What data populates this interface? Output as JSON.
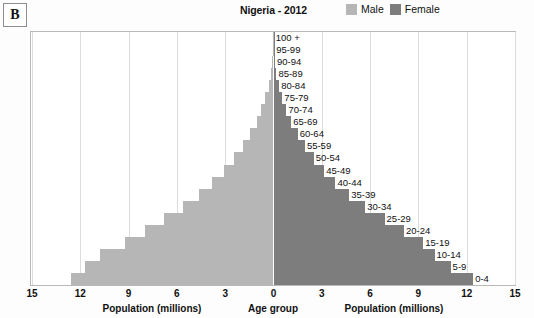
{
  "panel": {
    "letter": "B"
  },
  "header": {
    "title": "Nigeria - 2012",
    "legend": [
      {
        "label": "Male",
        "color": "#b6b6b6",
        "icon": "male-swatch"
      },
      {
        "label": "Female",
        "color": "#7d7d7d",
        "icon": "female-swatch"
      }
    ]
  },
  "axis": {
    "left_title": "Population (millions)",
    "center_title": "Age group",
    "right_title": "Population (millions)",
    "ticks": [
      "15",
      "12",
      "9",
      "6",
      "3",
      "0",
      "3",
      "6",
      "9",
      "12",
      "15"
    ]
  },
  "chart_data": {
    "type": "bar",
    "subtype": "population-pyramid",
    "title": "Nigeria - 2012",
    "xlabel": "Population (millions)",
    "ylabel": "Age group",
    "xlim": [
      -15,
      15
    ],
    "x_tick_values": [
      -15,
      -12,
      -9,
      -6,
      -3,
      0,
      3,
      6,
      9,
      12,
      15
    ],
    "x_tick_labels": [
      "15",
      "12",
      "9",
      "6",
      "3",
      "0",
      "3",
      "6",
      "9",
      "12",
      "15"
    ],
    "grid": true,
    "legend_position": "top-right",
    "categories": [
      "100 +",
      "95-99",
      "90-94",
      "85-89",
      "80-84",
      "75-79",
      "70-74",
      "65-69",
      "60-64",
      "55-59",
      "50-54",
      "45-49",
      "40-44",
      "35-39",
      "30-34",
      "25-29",
      "20-24",
      "15-19",
      "10-14",
      "5-9",
      "0-4"
    ],
    "series": [
      {
        "name": "Male",
        "color": "#b6b6b6",
        "side": "left",
        "values": [
          0.01,
          0.03,
          0.07,
          0.15,
          0.3,
          0.5,
          0.75,
          1.05,
          1.45,
          1.9,
          2.45,
          3.1,
          3.8,
          4.6,
          5.6,
          6.8,
          8.0,
          9.2,
          10.8,
          11.7,
          12.6
        ]
      },
      {
        "name": "Female",
        "color": "#7d7d7d",
        "side": "right",
        "values": [
          0.01,
          0.04,
          0.09,
          0.18,
          0.35,
          0.55,
          0.8,
          1.1,
          1.5,
          1.95,
          2.5,
          3.15,
          3.85,
          4.7,
          5.7,
          6.9,
          8.1,
          9.3,
          10.0,
          11.0,
          12.4
        ]
      }
    ]
  }
}
